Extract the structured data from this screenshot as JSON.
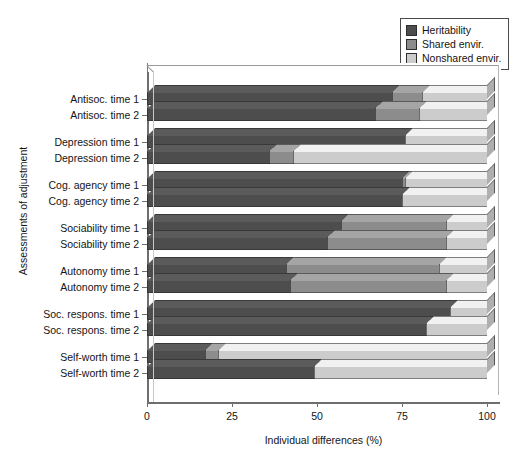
{
  "chart_data": {
    "type": "bar",
    "orientation": "horizontal",
    "stacked": true,
    "title": "",
    "xlabel": "Individual differences (%)",
    "ylabel": "Assessments of adjustment",
    "xlim": [
      0,
      100
    ],
    "xticks": [
      0,
      25,
      50,
      75,
      100
    ],
    "xtick_labels": [
      "0",
      "25",
      "50",
      "75",
      "100"
    ],
    "grid": false,
    "legend_position": "top-right",
    "categories": [
      "Antisoc. time 1",
      "Antisoc. time 2",
      "Depression time 1",
      "Depression time 2",
      "Cog. agency time 1",
      "Cog. agency time 2",
      "Sociability time 1",
      "Sociability time 2",
      "Autonomy time 1",
      "Autonomy time 2",
      "Soc. respons. time 1",
      "Soc. respons. time 2",
      "Self-worth time 1",
      "Self-worth time 2"
    ],
    "series": [
      {
        "name": "Heritability",
        "color": "#4d4d4d",
        "values": [
          72,
          67,
          76,
          36,
          75,
          75,
          57,
          53,
          41,
          42,
          89,
          82,
          17,
          49
        ]
      },
      {
        "name": "Shared envir.",
        "color": "#8c8c8c",
        "values": [
          9,
          13,
          0,
          7,
          1,
          0,
          31,
          35,
          45,
          46,
          0,
          0,
          4,
          0
        ]
      },
      {
        "name": "Nonshared envir.",
        "color": "#cccccc",
        "values": [
          19,
          20,
          24,
          57,
          24,
          25,
          12,
          12,
          14,
          12,
          11,
          18,
          79,
          51
        ]
      }
    ],
    "groups": [
      [
        "Antisoc. time 1",
        "Antisoc. time 2"
      ],
      [
        "Depression time 1",
        "Depression time 2"
      ],
      [
        "Cog. agency time 1",
        "Cog. agency time 2"
      ],
      [
        "Sociability time 1",
        "Sociability time 2"
      ],
      [
        "Autonomy time 1",
        "Autonomy time 2"
      ],
      [
        "Soc. respons. time 1",
        "Soc. respons. time 2"
      ],
      [
        "Self-worth time 1",
        "Self-worth time 2"
      ]
    ]
  },
  "legend": {
    "items": [
      {
        "label": "Heritability",
        "color": "#4d4d4d"
      },
      {
        "label": "Shared envir.",
        "color": "#8c8c8c"
      },
      {
        "label": "Nonshared envir.",
        "color": "#cccccc"
      }
    ]
  },
  "axes": {
    "x_title": "Individual differences (%)",
    "y_title": "Assessments of adjustment"
  }
}
